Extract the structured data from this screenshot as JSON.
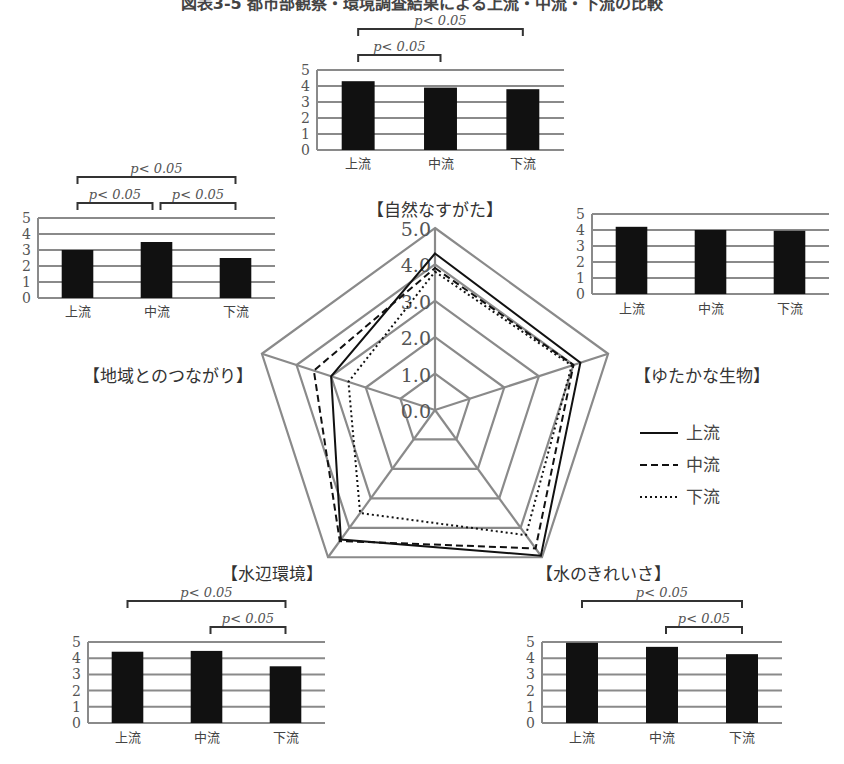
{
  "title": "図表3-5 都市部観察・環境調査結果による上流・中流・下流の比較",
  "chart_data": [
    {
      "type": "radar",
      "title": "",
      "axes": [
        "自然なすがた",
        "ゆたかな生物",
        "水のきれいさ",
        "水辺環境",
        "地域とのつながり"
      ],
      "axis_labels": [
        "【自然なすがた】",
        "【ゆたかな生物】",
        "【水のきれいさ】",
        "【水辺環境】",
        "【地域とのつながり】"
      ],
      "ticks": [
        "0.0",
        "1.0",
        "2.0",
        "3.0",
        "4.0",
        "5.0"
      ],
      "range": [
        0,
        5
      ],
      "series": [
        {
          "name": "上流",
          "style": "solid",
          "values": [
            4.3,
            4.2,
            4.95,
            4.4,
            3.0
          ]
        },
        {
          "name": "中流",
          "style": "dashed",
          "values": [
            3.9,
            4.0,
            4.7,
            4.45,
            3.5
          ]
        },
        {
          "name": "下流",
          "style": "dotted",
          "values": [
            3.8,
            3.95,
            4.25,
            3.5,
            2.5
          ]
        }
      ],
      "legend": {
        "position": "right",
        "entries": [
          "上流",
          "中流",
          "下流"
        ]
      }
    },
    {
      "type": "bar",
      "id": "shizen",
      "category_label": "【自然なすがた】",
      "categories": [
        "上流",
        "中流",
        "下流"
      ],
      "values": [
        4.3,
        3.9,
        3.8
      ],
      "ylim": [
        0,
        5
      ],
      "yticks": [
        "0",
        "1",
        "2",
        "3",
        "4",
        "5"
      ],
      "significance": [
        {
          "from": 0,
          "to": 2,
          "label": "p< 0.05"
        },
        {
          "from": 0,
          "to": 1,
          "label": "p< 0.05"
        }
      ]
    },
    {
      "type": "bar",
      "id": "chiiki",
      "category_label": "【地域とのつながり】",
      "categories": [
        "上流",
        "中流",
        "下流"
      ],
      "values": [
        3.0,
        3.5,
        2.5
      ],
      "ylim": [
        0,
        5
      ],
      "yticks": [
        "0",
        "1",
        "2",
        "3",
        "4",
        "5"
      ],
      "significance": [
        {
          "from": 0,
          "to": 2,
          "label": "p< 0.05"
        },
        {
          "from": 0,
          "to": 1,
          "label": "p< 0.05"
        },
        {
          "from": 1,
          "to": 2,
          "label": "p< 0.05"
        }
      ]
    },
    {
      "type": "bar",
      "id": "seibutsu",
      "category_label": "【ゆたかな生物】",
      "categories": [
        "上流",
        "中流",
        "下流"
      ],
      "values": [
        4.2,
        4.0,
        3.95
      ],
      "ylim": [
        0,
        5
      ],
      "yticks": [
        "0",
        "1",
        "2",
        "3",
        "4",
        "5"
      ],
      "significance": []
    },
    {
      "type": "bar",
      "id": "mizube",
      "category_label": "【水辺環境】",
      "categories": [
        "上流",
        "中流",
        "下流"
      ],
      "values": [
        4.4,
        4.45,
        3.5
      ],
      "ylim": [
        0,
        5
      ],
      "yticks": [
        "0",
        "1",
        "2",
        "3",
        "4",
        "5"
      ],
      "significance": [
        {
          "from": 0,
          "to": 2,
          "label": "p< 0.05"
        },
        {
          "from": 1,
          "to": 2,
          "label": "p< 0.05"
        }
      ]
    },
    {
      "type": "bar",
      "id": "kirei",
      "category_label": "【水のきれいさ】",
      "categories": [
        "上流",
        "中流",
        "下流"
      ],
      "values": [
        4.95,
        4.7,
        4.25
      ],
      "ylim": [
        0,
        5
      ],
      "yticks": [
        "0",
        "1",
        "2",
        "3",
        "4",
        "5"
      ],
      "significance": [
        {
          "from": 0,
          "to": 2,
          "label": "p< 0.05"
        },
        {
          "from": 1,
          "to": 2,
          "label": "p< 0.05"
        }
      ]
    }
  ],
  "layout": {
    "radar": {
      "cx": 435,
      "cy": 410,
      "r": 182
    },
    "bars": {
      "shizen": {
        "x": 317,
        "y": 70,
        "w": 247,
        "h": 80,
        "labelY": 168,
        "bracketBase": 55
      },
      "chiiki": {
        "x": 38,
        "y": 218,
        "w": 237,
        "h": 80,
        "labelY": 316,
        "bracketBase": 203
      },
      "seibutsu": {
        "x": 592,
        "y": 214,
        "w": 237,
        "h": 80,
        "labelY": 313,
        "bracketBase": 0
      },
      "mizube": {
        "x": 88,
        "y": 642,
        "w": 237,
        "h": 81,
        "labelY": 742,
        "bracketBase": 627
      },
      "kirei": {
        "x": 542,
        "y": 642,
        "w": 240,
        "h": 81,
        "labelY": 742,
        "bracketBase": 627
      }
    },
    "axisLabelPos": [
      {
        "x": 435,
        "y": 216,
        "anchor": "middle"
      },
      {
        "x": 702,
        "y": 382,
        "anchor": "middle"
      },
      {
        "x": 603,
        "y": 580,
        "anchor": "middle"
      },
      {
        "x": 272,
        "y": 580,
        "anchor": "middle"
      },
      {
        "x": 168,
        "y": 382,
        "anchor": "middle"
      }
    ],
    "legend": {
      "x": 640,
      "y": 433,
      "dy": 32
    }
  },
  "colors": {
    "grid": "#8a8a8a",
    "bar": "#111111",
    "line": "#111111",
    "text": "#555555"
  }
}
